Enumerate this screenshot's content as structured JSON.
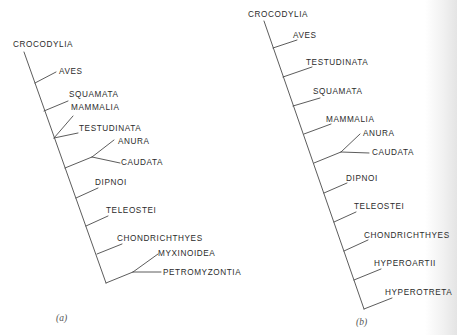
{
  "figure": {
    "panels": [
      {
        "id": "a",
        "label": "(a)",
        "label_pos": [
          56,
          321
        ],
        "taxa": [
          {
            "name": "CROCODYLIA",
            "x": 13,
            "y": 47
          },
          {
            "name": "AVES",
            "x": 59,
            "y": 74
          },
          {
            "name": "SQUAMATA",
            "x": 69,
            "y": 97
          },
          {
            "name": "MAMMALIA",
            "x": 71,
            "y": 110
          },
          {
            "name": "TESTUDINATA",
            "x": 79,
            "y": 131
          },
          {
            "name": "ANURA",
            "x": 118,
            "y": 144
          },
          {
            "name": "CAUDATA",
            "x": 121,
            "y": 165
          },
          {
            "name": "DIPNOI",
            "x": 95,
            "y": 185
          },
          {
            "name": "TELEOSTEI",
            "x": 106,
            "y": 213
          },
          {
            "name": "CHONDRICHTHYES",
            "x": 117,
            "y": 241
          },
          {
            "name": "MYXINOIDEA",
            "x": 158,
            "y": 256
          },
          {
            "name": "PETROMYZONTIA",
            "x": 163,
            "y": 275
          }
        ],
        "branches": [
          [
            24,
            52,
            106,
            283
          ],
          [
            35,
            83,
            56,
            72
          ],
          [
            44,
            111,
            68,
            101
          ],
          [
            54,
            138,
            73,
            116
          ],
          [
            54,
            138,
            78,
            133
          ],
          [
            65,
            168,
            92,
            157
          ],
          [
            92,
            157,
            114,
            140
          ],
          [
            92,
            157,
            120,
            163
          ],
          [
            76,
            198,
            98,
            188
          ],
          [
            86,
            226,
            108,
            216
          ],
          [
            97,
            254,
            122,
            244
          ],
          [
            106,
            283,
            133,
            272
          ],
          [
            133,
            272,
            158,
            254
          ],
          [
            133,
            272,
            161,
            272
          ]
        ]
      },
      {
        "id": "b",
        "label": "(b)",
        "label_pos": [
          356,
          325
        ],
        "taxa": [
          {
            "name": "CROCODYLIA",
            "x": 248,
            "y": 17
          },
          {
            "name": "AVES",
            "x": 293,
            "y": 38
          },
          {
            "name": "TESTUDINATA",
            "x": 306,
            "y": 65
          },
          {
            "name": "SQUAMATA",
            "x": 313,
            "y": 94
          },
          {
            "name": "MAMMALIA",
            "x": 326,
            "y": 122
          },
          {
            "name": "ANURA",
            "x": 363,
            "y": 136
          },
          {
            "name": "CAUDATA",
            "x": 372,
            "y": 155
          },
          {
            "name": "DIPNOI",
            "x": 346,
            "y": 181
          },
          {
            "name": "TELEOSTEI",
            "x": 354,
            "y": 209
          },
          {
            "name": "CHONDRICHTHYES",
            "x": 364,
            "y": 238
          },
          {
            "name": "HYPEROARTII",
            "x": 374,
            "y": 266
          },
          {
            "name": "HYPEROTRETA",
            "x": 385,
            "y": 295
          }
        ],
        "branches": [
          [
            264,
            21,
            364,
            309
          ],
          [
            273,
            48,
            297,
            40
          ],
          [
            283,
            77,
            312,
            67
          ],
          [
            293,
            106,
            320,
            98
          ],
          [
            304,
            134,
            331,
            124
          ],
          [
            314,
            163,
            341,
            152
          ],
          [
            341,
            152,
            360,
            134
          ],
          [
            341,
            152,
            369,
            153
          ],
          [
            324,
            193,
            347,
            183
          ],
          [
            334,
            222,
            356,
            212
          ],
          [
            344,
            251,
            368,
            240
          ],
          [
            354,
            280,
            381,
            269
          ],
          [
            364,
            309,
            392,
            298
          ]
        ]
      }
    ]
  }
}
